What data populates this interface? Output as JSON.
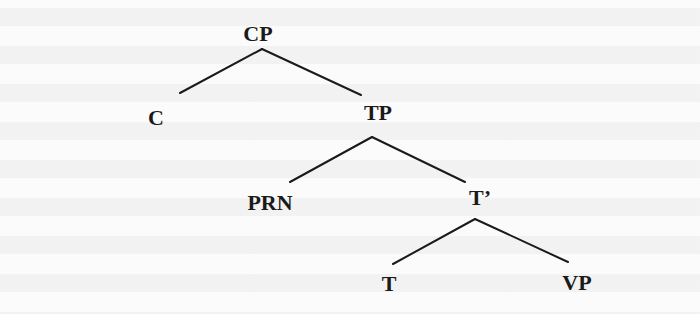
{
  "diagram": {
    "type": "syntax-tree",
    "root": "CP",
    "nodes": {
      "cp": "CP",
      "c": "C",
      "tp": "TP",
      "prn": "PRN",
      "tbar": "T’",
      "t": "T",
      "vp": "VP"
    },
    "edges": [
      [
        "CP",
        "C"
      ],
      [
        "CP",
        "TP"
      ],
      [
        "TP",
        "PRN"
      ],
      [
        "TP",
        "T’"
      ],
      [
        "T’",
        "T"
      ],
      [
        "T’",
        "VP"
      ]
    ],
    "line_color": "#1a1a1a",
    "label_color": "#1a1a1a"
  }
}
